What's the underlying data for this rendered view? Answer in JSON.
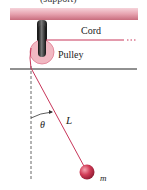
{
  "figure": {
    "top_caption_cut": "(support)",
    "labels": {
      "cord": "Cord",
      "pulley": "Pulley",
      "angle": "θ",
      "length": "L",
      "mass": "m"
    },
    "colors": {
      "support": "#e3a1ad",
      "support_shadow": "#c56878",
      "rod": "#2a2a2a",
      "pulley": "#f1b8c2",
      "cord": "#c8365a",
      "bob": "#d33a55",
      "ground_line": "#222222",
      "dashed_line": "#666666"
    }
  }
}
